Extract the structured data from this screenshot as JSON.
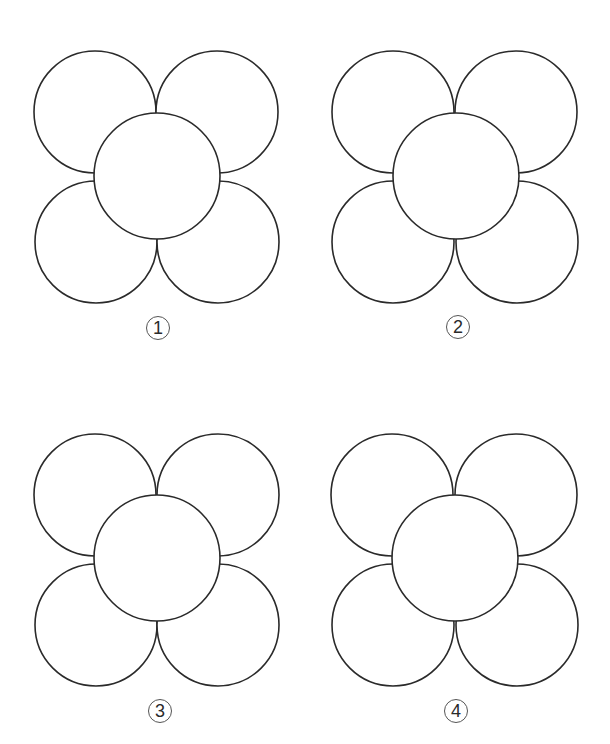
{
  "figures": [
    {
      "label": "1",
      "outer_circles": [
        {
          "cx": 95,
          "cy": 112,
          "r": 61
        },
        {
          "cx": 217,
          "cy": 112,
          "r": 61
        },
        {
          "cx": 96,
          "cy": 242,
          "r": 61
        },
        {
          "cx": 218,
          "cy": 242,
          "r": 61
        }
      ],
      "center_circle": {
        "cx": 157,
        "cy": 176,
        "r": 63
      },
      "label_pos": {
        "x": 146,
        "y": 316
      }
    },
    {
      "label": "2",
      "outer_circles": [
        {
          "cx": 393,
          "cy": 112,
          "r": 61
        },
        {
          "cx": 516,
          "cy": 112,
          "r": 61
        },
        {
          "cx": 393,
          "cy": 242,
          "r": 61
        },
        {
          "cx": 517,
          "cy": 242,
          "r": 61
        }
      ],
      "center_circle": {
        "cx": 456,
        "cy": 176,
        "r": 63
      },
      "label_pos": {
        "x": 446,
        "y": 315
      }
    },
    {
      "label": "3",
      "outer_circles": [
        {
          "cx": 95,
          "cy": 495,
          "r": 61
        },
        {
          "cx": 218,
          "cy": 495,
          "r": 61
        },
        {
          "cx": 96,
          "cy": 625,
          "r": 61
        },
        {
          "cx": 218,
          "cy": 625,
          "r": 61
        }
      ],
      "center_circle": {
        "cx": 157,
        "cy": 558,
        "r": 63
      },
      "label_pos": {
        "x": 148,
        "y": 699
      }
    },
    {
      "label": "4",
      "outer_circles": [
        {
          "cx": 392,
          "cy": 495,
          "r": 61
        },
        {
          "cx": 516,
          "cy": 495,
          "r": 61
        },
        {
          "cx": 393,
          "cy": 625,
          "r": 61
        },
        {
          "cx": 517,
          "cy": 625,
          "r": 61
        }
      ],
      "center_circle": {
        "cx": 455,
        "cy": 558,
        "r": 63
      },
      "label_pos": {
        "x": 444,
        "y": 699
      }
    }
  ],
  "labels": {
    "f1": "①",
    "f2": "②",
    "f3": "③",
    "f4": "④"
  },
  "colors": {
    "stroke": "#2a2a2a",
    "background": "#ffffff"
  }
}
